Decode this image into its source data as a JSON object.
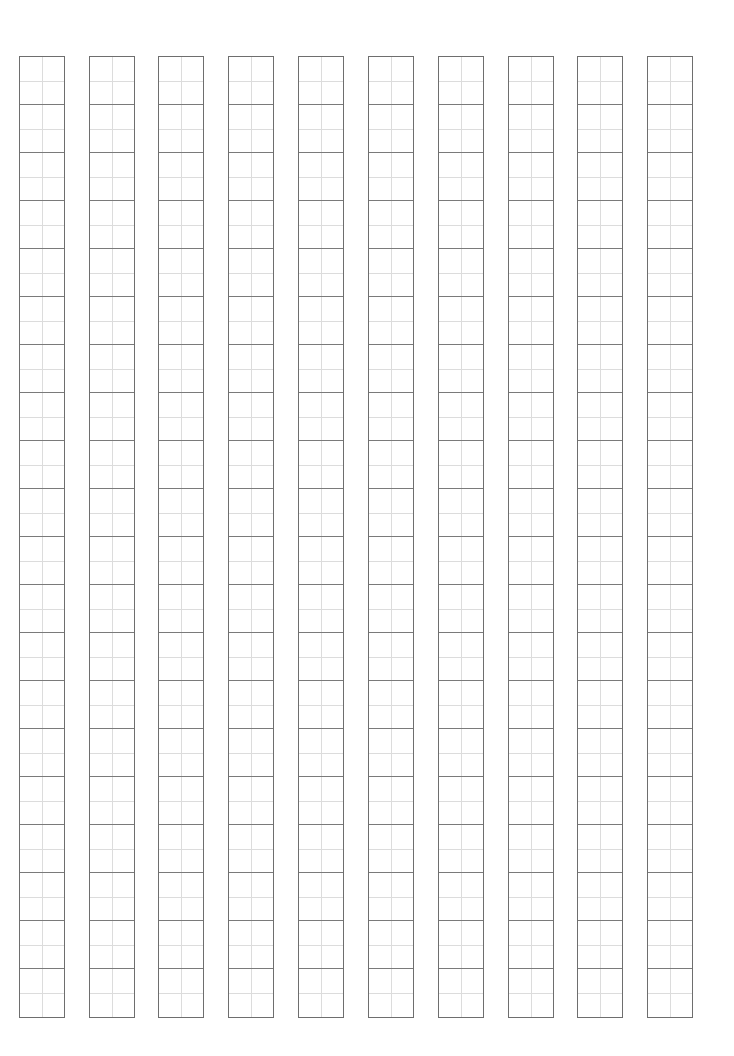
{
  "sheet": {
    "type": "writing-grid-paper",
    "columns": 10,
    "cells_per_column": 20,
    "column_x": [
      19,
      89,
      158,
      228,
      298,
      368,
      438,
      508,
      577,
      647
    ],
    "column_width": 46,
    "cell_height": 48,
    "colors": {
      "outline": "#6e6e6e",
      "cell_border": "#7a7a7a",
      "guide": "#dcdcdc",
      "background": "#ffffff"
    }
  }
}
